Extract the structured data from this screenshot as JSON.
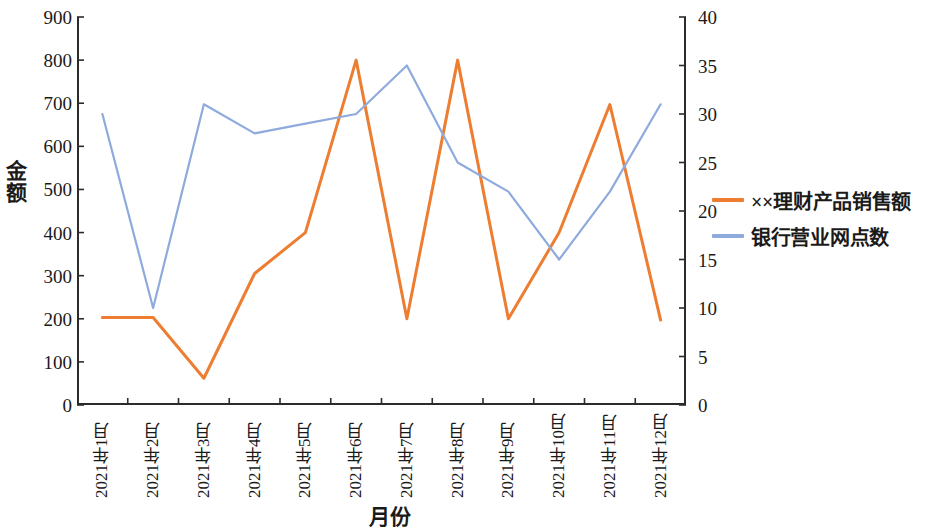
{
  "chart_data": {
    "type": "line",
    "title": "",
    "xlabel": "月份",
    "ylabel": "金额",
    "y2label": "",
    "grid": false,
    "legend_position": "right",
    "categories": [
      "2021年1月",
      "2021年2月",
      "2021年3月",
      "2021年4月",
      "2021年5月",
      "2021年6月",
      "2021年7月",
      "2021年8月",
      "2021年9月",
      "2021年10月",
      "2021年11月",
      "2021年12月"
    ],
    "ylim": [
      0,
      900
    ],
    "yticks": [
      0,
      100,
      200,
      300,
      400,
      500,
      600,
      700,
      800,
      900
    ],
    "y2lim": [
      0,
      40
    ],
    "y2ticks": [
      0,
      5,
      10,
      15,
      20,
      25,
      30,
      35,
      40
    ],
    "series": [
      {
        "name": "××理财产品销售额",
        "axis": "left",
        "color": "#ED7D31",
        "values": [
          203,
          203,
          62,
          305,
          400,
          800,
          200,
          800,
          200,
          400,
          697,
          197
        ]
      },
      {
        "name": "银行营业网点数",
        "axis": "right",
        "color": "#8FAADC",
        "values": [
          30,
          10,
          31,
          28,
          29,
          30,
          35,
          25,
          22,
          15,
          22,
          31
        ]
      }
    ]
  },
  "axes": {
    "left": {
      "title": "金额",
      "ticks": [
        "900",
        "800",
        "700",
        "600",
        "500",
        "400",
        "300",
        "200",
        "100",
        "0"
      ]
    },
    "right": {
      "ticks": [
        "40",
        "35",
        "30",
        "25",
        "20",
        "15",
        "10",
        "5",
        "0"
      ]
    },
    "bottom": {
      "title": "月份",
      "ticks": [
        "2021年1月",
        "2021年2月",
        "2021年3月",
        "2021年4月",
        "2021年5月",
        "2021年6月",
        "2021年7月",
        "2021年8月",
        "2021年9月",
        "2021年10月",
        "2021年11月",
        "2021年12月"
      ]
    }
  },
  "legend": {
    "items": [
      {
        "label": "××理财产品销售额",
        "color": "#ED7D31"
      },
      {
        "label": "银行营业网点数",
        "color": "#8FAADC"
      }
    ]
  }
}
